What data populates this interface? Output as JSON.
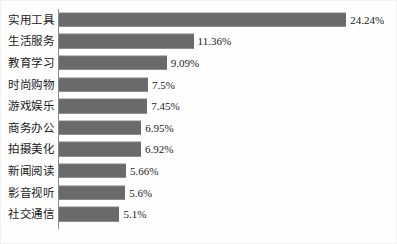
{
  "chart_data": {
    "type": "bar",
    "orientation": "horizontal",
    "title": "",
    "subtitle": "",
    "xlabel": "",
    "ylabel": "",
    "grid": false,
    "legend": false,
    "legend_position": "none",
    "xlim": [
      0,
      24.24
    ],
    "value_suffix": "%",
    "bar_color": "#6a6a6a",
    "axis_color": "#8a8a8a",
    "text_color": "#1b1b1b",
    "categories": [
      "实用工具",
      "生活服务",
      "教育学习",
      "时尚购物",
      "游戏娱乐",
      "商务办公",
      "拍摄美化",
      "新闻阅读",
      "影音视听",
      "社交通信"
    ],
    "values": [
      24.24,
      11.36,
      9.09,
      7.5,
      7.45,
      6.95,
      6.92,
      5.66,
      5.6,
      5.1
    ],
    "value_labels": [
      "24.24%",
      "11.36%",
      "9.09%",
      "7.5%",
      "7.45%",
      "6.95%",
      "6.92%",
      "5.66%",
      "5.6%",
      "5.1%"
    ],
    "bars": [
      {
        "category": "实用工具",
        "value": 24.24,
        "label": "24.24%"
      },
      {
        "category": "生活服务",
        "value": 11.36,
        "label": "11.36%"
      },
      {
        "category": "教育学习",
        "value": 9.09,
        "label": "9.09%"
      },
      {
        "category": "时尚购物",
        "value": 7.5,
        "label": "7.5%"
      },
      {
        "category": "游戏娱乐",
        "value": 7.45,
        "label": "7.45%"
      },
      {
        "category": "商务办公",
        "value": 6.95,
        "label": "6.95%"
      },
      {
        "category": "拍摄美化",
        "value": 6.92,
        "label": "6.92%"
      },
      {
        "category": "新闻阅读",
        "value": 5.66,
        "label": "5.66%"
      },
      {
        "category": "影音视听",
        "value": 5.6,
        "label": "5.6%"
      },
      {
        "category": "社交通信",
        "value": 5.1,
        "label": "5.1%"
      }
    ]
  }
}
